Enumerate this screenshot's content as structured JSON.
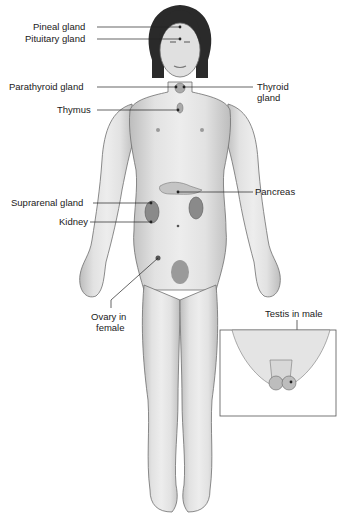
{
  "diagram": {
    "labels": [
      {
        "id": "pineal",
        "text": "Pineal gland"
      },
      {
        "id": "pituitary",
        "text": "Pituitary gland"
      },
      {
        "id": "parathyroid",
        "text": "Parathyroid gland"
      },
      {
        "id": "thyroid_1",
        "text": "Thyroid"
      },
      {
        "id": "thyroid_2",
        "text": "gland"
      },
      {
        "id": "thymus",
        "text": "Thymus"
      },
      {
        "id": "pancreas",
        "text": "Pancreas"
      },
      {
        "id": "suprarenal",
        "text": "Suprarenal gland"
      },
      {
        "id": "kidney",
        "text": "Kidney"
      },
      {
        "id": "ovary_1",
        "text": "Ovary in"
      },
      {
        "id": "ovary_2",
        "text": "female"
      },
      {
        "id": "testis",
        "text": "Testis in male"
      }
    ],
    "colors": {
      "skin_light": "#e6e6e6",
      "skin_mid": "#c8c8c8",
      "outline": "#6e6e6e",
      "hair": "#2a2a2a",
      "leader": "#222222",
      "inset_border": "#555555"
    }
  }
}
